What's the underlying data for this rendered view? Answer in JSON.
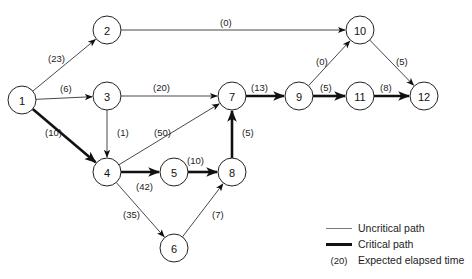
{
  "diagram": {
    "type": "PERT network",
    "nodes": [
      {
        "id": "1",
        "x": 22,
        "y": 100
      },
      {
        "id": "2",
        "x": 107,
        "y": 30
      },
      {
        "id": "3",
        "x": 107,
        "y": 96
      },
      {
        "id": "4",
        "x": 107,
        "y": 172
      },
      {
        "id": "5",
        "x": 174,
        "y": 172
      },
      {
        "id": "6",
        "x": 174,
        "y": 248
      },
      {
        "id": "7",
        "x": 232,
        "y": 96
      },
      {
        "id": "8",
        "x": 232,
        "y": 172
      },
      {
        "id": "9",
        "x": 299,
        "y": 96
      },
      {
        "id": "10",
        "x": 360,
        "y": 30
      },
      {
        "id": "11",
        "x": 360,
        "y": 96
      },
      {
        "id": "12",
        "x": 424,
        "y": 96
      }
    ],
    "edges": [
      {
        "from": "1",
        "to": "2",
        "label": "(23)",
        "critical": false,
        "lx": 48,
        "ly": 62
      },
      {
        "from": "1",
        "to": "3",
        "label": "(6)",
        "critical": false,
        "lx": 60,
        "ly": 92
      },
      {
        "from": "1",
        "to": "4",
        "label": "(10)",
        "critical": true,
        "lx": 45,
        "ly": 136
      },
      {
        "from": "2",
        "to": "10",
        "label": "(0)",
        "critical": false,
        "lx": 220,
        "ly": 26
      },
      {
        "from": "3",
        "to": "7",
        "label": "(20)",
        "critical": false,
        "lx": 153,
        "ly": 91
      },
      {
        "from": "3",
        "to": "4",
        "label": "(1)",
        "critical": false,
        "lx": 117,
        "ly": 136
      },
      {
        "from": "4",
        "to": "7",
        "label": "(50)",
        "critical": false,
        "lx": 154,
        "ly": 136
      },
      {
        "from": "4",
        "to": "5",
        "label": "(42)",
        "critical": true,
        "lx": 136,
        "ly": 190
      },
      {
        "from": "4",
        "to": "6",
        "label": "(35)",
        "critical": false,
        "lx": 123,
        "ly": 218
      },
      {
        "from": "5",
        "to": "8",
        "label": "(10)",
        "critical": true,
        "lx": 187,
        "ly": 164
      },
      {
        "from": "6",
        "to": "8",
        "label": "(7)",
        "critical": false,
        "lx": 212,
        "ly": 218
      },
      {
        "from": "8",
        "to": "7",
        "label": "(5)",
        "critical": true,
        "lx": 242,
        "ly": 136
      },
      {
        "from": "7",
        "to": "9",
        "label": "(13)",
        "critical": true,
        "lx": 251,
        "ly": 91
      },
      {
        "from": "9",
        "to": "10",
        "label": "(0)",
        "critical": false,
        "lx": 316,
        "ly": 65
      },
      {
        "from": "9",
        "to": "11",
        "label": "(5)",
        "critical": true,
        "lx": 320,
        "ly": 91
      },
      {
        "from": "10",
        "to": "12",
        "label": "(5)",
        "critical": false,
        "lx": 396,
        "ly": 65
      },
      {
        "from": "11",
        "to": "12",
        "label": "(8)",
        "critical": true,
        "lx": 380,
        "ly": 91
      }
    ]
  },
  "legend": {
    "uncritical": "Uncritical path",
    "critical": "Critical path",
    "key_sample": "(20)",
    "key_text": "Expected elapsed time"
  }
}
